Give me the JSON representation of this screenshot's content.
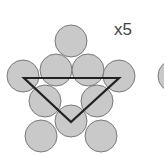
{
  "label": "x5",
  "colors": {
    "fill": "#c9c9c9",
    "stroke": "#7a7a7a",
    "triangle": "#222222"
  },
  "circles": [
    {
      "cx": 71,
      "cy": 41
    },
    {
      "cx": 56,
      "cy": 70
    },
    {
      "cx": 88,
      "cy": 70
    },
    {
      "cx": 23,
      "cy": 76
    },
    {
      "cx": 119,
      "cy": 76
    },
    {
      "cx": 45,
      "cy": 101
    },
    {
      "cx": 97,
      "cy": 101
    },
    {
      "cx": 71,
      "cy": 121
    },
    {
      "cx": 41,
      "cy": 136
    },
    {
      "cx": 101,
      "cy": 136
    },
    {
      "cx": 174,
      "cy": 76
    }
  ],
  "radius": 16,
  "triangle": "24,78 119,78 71,122"
}
